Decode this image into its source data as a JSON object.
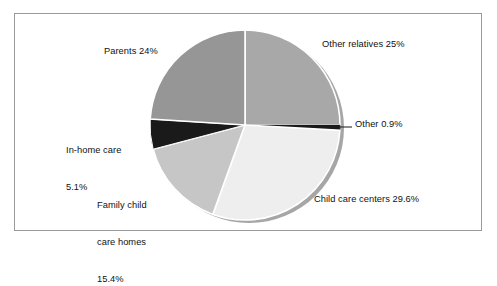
{
  "figure": {
    "border_color": "#9a9a9a",
    "background": "#ffffff"
  },
  "chart_data": {
    "type": "pie",
    "title": "",
    "subtitle": "",
    "xlabel": "",
    "ylabel": "",
    "legend_position": "none",
    "grid": false,
    "start_angle_deg": 0,
    "direction": "clockwise",
    "categories": [
      "Other relatives",
      "Other",
      "Child care centers",
      "Family child care homes",
      "In-home care",
      "Parents"
    ],
    "values": [
      25,
      0.9,
      29.6,
      15.4,
      5.1,
      24
    ],
    "value_labels": [
      "25%",
      "0.9%",
      "29.6%",
      "15.4%",
      "5.1%",
      "24%"
    ],
    "annotations": [
      "Other relatives 25%",
      "Other 0.9%",
      "Child care centers 29.6%",
      "Family child care homes 15.4%",
      "In-home care 5.1%",
      "Parents 24%"
    ],
    "slice_colors": [
      "#a8a8a8",
      "#1a1a1a",
      "#eeeeee",
      "#c6c6c6",
      "#1a1a1a",
      "#969696"
    ],
    "slice_edge_color": "#ffffff",
    "shadow_color": "#a6a6a6"
  },
  "labels": {
    "other_relatives": "Other relatives 25%",
    "parents": "Parents 24%",
    "other": "Other 0.9%",
    "in_home_care_line1": "In-home care",
    "in_home_care_line2": "5.1%",
    "family_child_care_line1": "Family child",
    "family_child_care_line2": "care homes",
    "family_child_care_line3": "15.4%",
    "child_care_centers": "Child care centers 29.6%"
  }
}
